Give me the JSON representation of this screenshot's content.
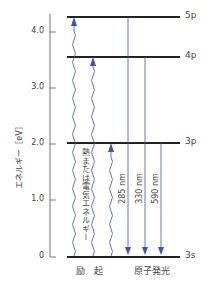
{
  "axis": {
    "label": "エネルギー［eV］",
    "ticks": [
      {
        "value": 0,
        "label": "0",
        "y": 257
      },
      {
        "value": 1.0,
        "label": "1.0",
        "y": 200
      },
      {
        "value": 2.0,
        "label": "2.0",
        "y": 144
      },
      {
        "value": 3.0,
        "label": "3.0",
        "y": 88
      },
      {
        "value": 4.0,
        "label": "4.0",
        "y": 32
      }
    ]
  },
  "levels": [
    {
      "name": "3s",
      "label": "3s",
      "energy_ev": 0,
      "y": 257
    },
    {
      "name": "3p",
      "label": "3p",
      "energy_ev": 2.1,
      "y": 143
    },
    {
      "name": "4p",
      "label": "4p",
      "energy_ev": 3.6,
      "y": 57
    },
    {
      "name": "5p",
      "label": "5p",
      "energy_ev": 4.3,
      "y": 17
    }
  ],
  "excitation": {
    "label": "励　起",
    "energy_text": "熱または電気エネルギー",
    "transitions": [
      {
        "from": "3s",
        "to": "5p",
        "x": 74
      },
      {
        "from": "3s",
        "to": "4p",
        "x": 93
      },
      {
        "from": "3s",
        "to": "3p",
        "x": 111
      }
    ]
  },
  "emission": {
    "label": "原子発光",
    "transitions": [
      {
        "from": "5p",
        "to": "3s",
        "wavelength": "285 nm",
        "x": 128
      },
      {
        "from": "4p",
        "to": "3s",
        "wavelength": "330 nm",
        "x": 145
      },
      {
        "from": "3p",
        "to": "3s",
        "wavelength": "590 nm",
        "x": 161
      }
    ]
  },
  "colors": {
    "arrow": "#3b55b0",
    "level": "#222222",
    "axis": "#777777"
  }
}
